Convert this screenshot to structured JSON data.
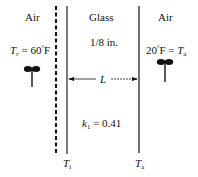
{
  "diagram": {
    "left_region": {
      "label": "Air",
      "temperature_symbol": "T",
      "temperature_subscript": "r",
      "temperature_value": "= 60",
      "temperature_unit": "F",
      "degree": "°",
      "fan_icon": "fan-icon"
    },
    "middle_region": {
      "label": "Glass",
      "thickness": "1/8 in.",
      "length_label": "L",
      "conductivity_symbol": "k",
      "conductivity_subscript": "1",
      "conductivity_value": "= 0.41"
    },
    "right_region": {
      "label": "Air",
      "temperature_value": "20",
      "degree": "°",
      "temperature_unit": "F =",
      "temperature_symbol": "T",
      "temperature_subscript": "a",
      "fan_icon": "fan-icon"
    },
    "bottom_labels": {
      "inner_surface_symbol": "T",
      "inner_surface_subscript": "i",
      "outer_surface_symbol": "T",
      "outer_surface_subscript": "a"
    },
    "colors": {
      "line": "#111111",
      "background": "#ffffff"
    }
  }
}
